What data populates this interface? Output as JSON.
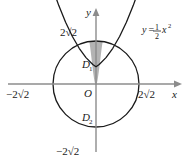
{
  "figure": {
    "axes": {
      "x_axis_label": "x",
      "y_axis_label": "y",
      "origin_label": "O",
      "axis_color": "#8c8c8c"
    },
    "ticks": {
      "y_top": "2√2",
      "y_bottom": "−2√2",
      "x_left": "−2√2",
      "x_right": "2√2"
    },
    "curves": {
      "parabola_label_y": "y",
      "parabola_label_eq": "=",
      "parabola_label_half_num": "1",
      "parabola_label_half_den": "2",
      "parabola_label_x": "x",
      "parabola_label_exp": "2",
      "circle_color": "#1a1a1a",
      "parabola_color": "#1a1a1a"
    },
    "regions": {
      "upper_base": "D",
      "upper_sub": "1",
      "lower_base": "D",
      "lower_sub": "2",
      "shade_fill": "#b3b3b3"
    }
  }
}
